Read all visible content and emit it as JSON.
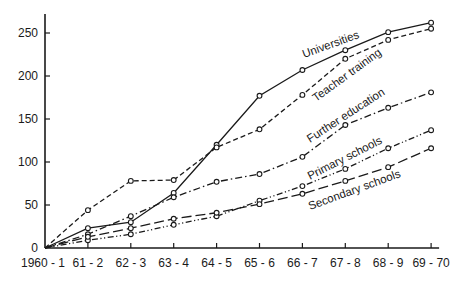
{
  "chart_data": {
    "type": "line",
    "title": "",
    "xlabel": "",
    "ylabel": "",
    "categories": [
      "1960 - 1",
      "61 - 2",
      "62 - 3",
      "63 - 4",
      "64 - 5",
      "65 - 6",
      "66 - 7",
      "67 - 8",
      "68 - 9",
      "69 - 70"
    ],
    "yticks": [
      0,
      50,
      100,
      150,
      200,
      250
    ],
    "ylim": [
      0,
      270
    ],
    "grid": false,
    "legend": "inline labels along lines",
    "series": [
      {
        "name": "Universities",
        "style": "solid",
        "values": [
          0,
          23,
          30,
          64,
          120,
          177,
          207,
          230,
          251,
          262
        ]
      },
      {
        "name": "Teacher training",
        "style": "dashed",
        "values": [
          0,
          44,
          78,
          79,
          117,
          138,
          178,
          220,
          242,
          255
        ]
      },
      {
        "name": "Further education",
        "style": "dash-dot",
        "values": [
          0,
          16,
          37,
          59,
          77,
          86,
          106,
          143,
          163,
          181
        ]
      },
      {
        "name": "Primary schools",
        "style": "dash-dot-dot",
        "values": [
          0,
          9,
          16,
          27,
          37,
          55,
          72,
          92,
          116,
          137
        ]
      },
      {
        "name": "Secondary schools",
        "style": "long-dash",
        "values": [
          0,
          13,
          23,
          34,
          41,
          51,
          63,
          78,
          94,
          116
        ]
      }
    ]
  },
  "labels": {
    "universities": "Universities",
    "teacher_training": "Teacher training",
    "further_education": "Further education",
    "primary_schools": "Primary schools",
    "secondary_schools": "Secondary schools"
  }
}
